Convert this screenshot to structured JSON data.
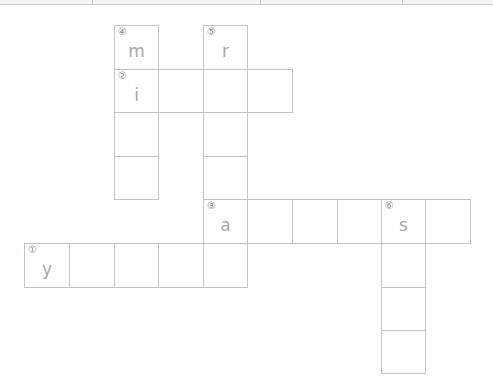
{
  "topbar": {
    "dividers": [
      92,
      260,
      402
    ]
  },
  "geometry": {
    "cols": [
      24,
      69,
      114,
      158,
      203,
      247,
      292,
      337,
      381,
      425,
      470
    ],
    "rows": [
      25,
      69,
      112,
      156,
      199,
      243,
      287,
      330,
      373
    ],
    "cell_w": 45,
    "cell_h": 44
  },
  "cells": [
    {
      "c": 2,
      "r": 0,
      "num": "④",
      "letter": "m"
    },
    {
      "c": 4,
      "r": 0,
      "num": "⑤",
      "letter": "r"
    },
    {
      "c": 2,
      "r": 1,
      "num": "②",
      "letter": "i"
    },
    {
      "c": 3,
      "r": 1,
      "num": "",
      "letter": ""
    },
    {
      "c": 4,
      "r": 1,
      "num": "",
      "letter": ""
    },
    {
      "c": 5,
      "r": 1,
      "num": "",
      "letter": ""
    },
    {
      "c": 2,
      "r": 2,
      "num": "",
      "letter": ""
    },
    {
      "c": 4,
      "r": 2,
      "num": "",
      "letter": ""
    },
    {
      "c": 2,
      "r": 3,
      "num": "",
      "letter": ""
    },
    {
      "c": 4,
      "r": 3,
      "num": "",
      "letter": ""
    },
    {
      "c": 4,
      "r": 4,
      "num": "③",
      "letter": "a"
    },
    {
      "c": 5,
      "r": 4,
      "num": "",
      "letter": ""
    },
    {
      "c": 6,
      "r": 4,
      "num": "",
      "letter": ""
    },
    {
      "c": 7,
      "r": 4,
      "num": "",
      "letter": ""
    },
    {
      "c": 8,
      "r": 4,
      "num": "⑥",
      "letter": "s"
    },
    {
      "c": 9,
      "r": 4,
      "num": "",
      "letter": ""
    },
    {
      "c": 0,
      "r": 5,
      "num": "①",
      "letter": "y"
    },
    {
      "c": 1,
      "r": 5,
      "num": "",
      "letter": ""
    },
    {
      "c": 2,
      "r": 5,
      "num": "",
      "letter": ""
    },
    {
      "c": 3,
      "r": 5,
      "num": "",
      "letter": ""
    },
    {
      "c": 4,
      "r": 5,
      "num": "",
      "letter": ""
    },
    {
      "c": 8,
      "r": 5,
      "num": "",
      "letter": ""
    },
    {
      "c": 8,
      "r": 6,
      "num": "",
      "letter": ""
    },
    {
      "c": 8,
      "r": 7,
      "num": "",
      "letter": ""
    }
  ]
}
